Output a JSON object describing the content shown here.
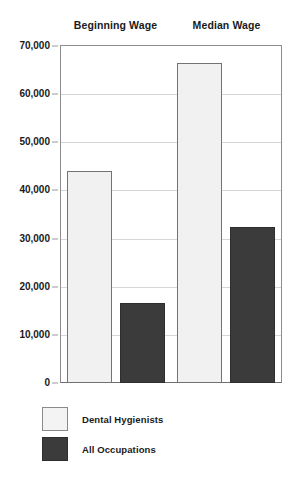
{
  "chart_data": {
    "type": "bar",
    "title": "",
    "subtitle": "",
    "xlabel": "",
    "ylabel": "",
    "categories": [
      "Beginning Wage",
      "Median Wage"
    ],
    "series": [
      {
        "name": "Dental Hygienists",
        "values": [
          44000,
          66400
        ],
        "color": "#f1f1f1"
      },
      {
        "name": "All Occupations",
        "values": [
          16600,
          32400
        ],
        "color": "#3b3b3b"
      }
    ],
    "ylim": [
      0,
      70000
    ],
    "yticks": [
      0,
      10000,
      20000,
      30000,
      40000,
      50000,
      60000,
      70000
    ],
    "ytick_labels": [
      "0",
      "10,000",
      "20,000",
      "30,000",
      "40,000",
      "50,000",
      "60,000",
      "70,000"
    ],
    "grid": true,
    "legend_position": "bottom-left"
  },
  "headers": [
    {
      "label": "Beginning Wage"
    },
    {
      "label": "Median Wage"
    }
  ],
  "legend": {
    "items": [
      {
        "label": "Dental Hygienists",
        "swatch": "light"
      },
      {
        "label": "All Occupations",
        "swatch": "dark"
      }
    ]
  }
}
